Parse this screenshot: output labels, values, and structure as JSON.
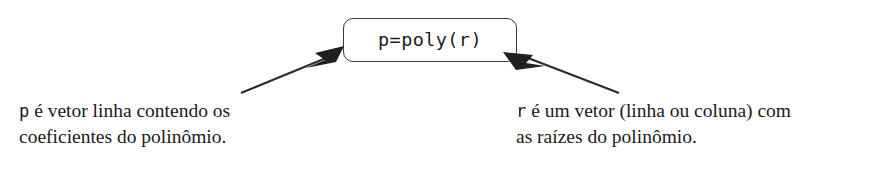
{
  "diagram": {
    "type": "annotated-syntax-callout",
    "language": "pt-BR",
    "colors": {
      "background": "#ffffff",
      "stroke": "#3a3a3a",
      "text": "#1a1a1a",
      "arrow": "#2b2b2b"
    },
    "code_box": {
      "label": "p=poly(r)",
      "shape": "rounded-rectangle"
    },
    "annotations": [
      {
        "id": "left",
        "variable": "p",
        "line1_rest": " é vetor linha contendo os",
        "line2": "coeficientes do polinômio.",
        "arrow_points_to": "p"
      },
      {
        "id": "right",
        "variable": "r",
        "line1_rest": " é um vetor (linha ou coluna) com",
        "line2": "as raízes do polinômio.",
        "arrow_points_to": "r"
      }
    ]
  }
}
